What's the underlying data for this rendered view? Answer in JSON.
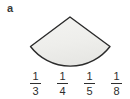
{
  "question": {
    "item_label": "a",
    "figure": {
      "shape_name": "circular-sector",
      "description": "Shaded circular sector with apex at top and arc at bottom",
      "fill_color": "#efefec",
      "stroke_color": "#2b2b2b",
      "apex_x": 70,
      "apex_y": 17,
      "left_corner_x": 30,
      "left_corner_y": 47,
      "right_corner_x": 110,
      "right_corner_y": 47,
      "arc_bottom_y": 70
    },
    "choices": [
      {
        "id": "choice-1",
        "numerator": "1",
        "denominator": "3",
        "value": "1/3"
      },
      {
        "id": "choice-2",
        "numerator": "1",
        "denominator": "4",
        "value": "1/4"
      },
      {
        "id": "choice-3",
        "numerator": "1",
        "denominator": "5",
        "value": "1/5"
      },
      {
        "id": "choice-4",
        "numerator": "1",
        "denominator": "8",
        "value": "1/8"
      }
    ]
  },
  "colors": {
    "background": "#ffffff",
    "text": "#2e2e2e",
    "label": "#3a3a3a",
    "shape_fill": "#efefec",
    "shape_stroke": "#2b2b2b"
  }
}
